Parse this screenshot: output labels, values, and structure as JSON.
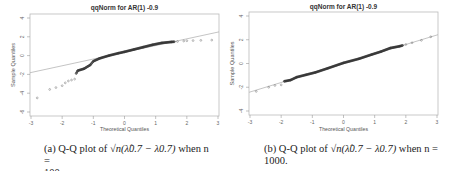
{
  "figure": {
    "panels": [
      {
        "id": "a",
        "title": "qqNorm for AR(1) -0.9",
        "xlabel": "Theoretical Quantiles",
        "ylabel": "Sample Quantiles",
        "caption_prefix": "(a) Q-Q plot of",
        "caption_math": "√n(λ̂0.7 − λ0.7)",
        "caption_suffix": "when n =",
        "caption_line2": "100."
      },
      {
        "id": "b",
        "title": "qqNorm for AR(1) -0.9",
        "xlabel": "Theoretical Quantiles",
        "ylabel": "Sample Quantiles",
        "caption_prefix": "(b) Q-Q plot of",
        "caption_math": "√n(λ̂0.7 − λ0.7)",
        "caption_suffix": "when n =",
        "caption_line2": "1000."
      }
    ]
  },
  "chart_data": [
    {
      "type": "scatter",
      "title": "qqNorm for AR(1) -0.9",
      "xlabel": "Theoretical Quantiles",
      "ylabel": "Sample Quantiles",
      "xlim": [
        -3,
        3
      ],
      "ylim": [
        -6,
        4
      ],
      "xticks": [
        -3,
        -2,
        -1,
        0,
        1,
        2,
        3
      ],
      "yticks": [
        -6,
        -4,
        -2,
        0,
        2,
        4
      ],
      "n": 100,
      "reference_line": {
        "x": [
          -3,
          3
        ],
        "y": [
          -1.8,
          2.5
        ]
      },
      "points_sample": {
        "x": [
          -2.8,
          -2.4,
          -2.2,
          -2.0,
          -1.9,
          -1.8,
          -1.7,
          -1.6,
          -1.55,
          -1.5,
          -1.3,
          -1.1,
          -1.0,
          -0.8,
          -0.5,
          -0.2,
          0.0,
          0.3,
          0.6,
          0.9,
          1.2,
          1.5,
          1.7,
          1.9,
          2.0,
          2.2,
          2.45,
          2.8
        ],
        "y": [
          -4.5,
          -3.6,
          -3.4,
          -3.2,
          -2.9,
          -2.7,
          -2.6,
          -2.5,
          -1.9,
          -1.6,
          -1.4,
          -1.0,
          -0.6,
          -0.3,
          0.0,
          0.25,
          0.4,
          0.65,
          0.9,
          1.15,
          1.35,
          1.45,
          1.5,
          1.55,
          1.58,
          1.6,
          1.62,
          1.65
        ]
      }
    },
    {
      "type": "scatter",
      "title": "qqNorm for AR(1) -0.9",
      "xlabel": "Theoretical Quantiles",
      "ylabel": "Sample Quantiles",
      "xlim": [
        -3,
        3
      ],
      "ylim": [
        -4,
        4
      ],
      "xticks": [
        -3,
        -2,
        -1,
        0,
        1,
        2,
        3
      ],
      "yticks": [
        -4,
        -2,
        0,
        2,
        4
      ],
      "n": 1000,
      "reference_line": {
        "x": [
          -3,
          3
        ],
        "y": [
          -2.4,
          2.4
        ]
      },
      "points_sample": {
        "x": [
          -2.8,
          -2.4,
          -2.2,
          -2.0,
          -1.9,
          -1.7,
          -1.5,
          -1.2,
          -0.9,
          -0.5,
          0.0,
          0.5,
          0.9,
          1.2,
          1.5,
          1.8,
          2.0,
          2.2,
          2.5,
          2.8
        ],
        "y": [
          -2.35,
          -2.0,
          -1.85,
          -1.8,
          -1.5,
          -1.4,
          -1.15,
          -0.95,
          -0.75,
          -0.4,
          0.05,
          0.4,
          0.75,
          1.0,
          1.3,
          1.45,
          1.6,
          1.75,
          1.95,
          2.25
        ]
      }
    }
  ]
}
